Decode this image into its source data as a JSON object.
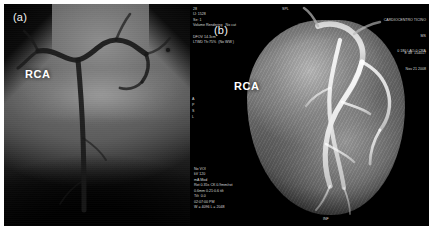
{
  "figure": {
    "caption_a": "(a)",
    "caption_b": "(b)"
  },
  "panel_a": {
    "modality": "invasive coronary angiography",
    "vessel_label": "RCA"
  },
  "panel_b": {
    "modality": "cardiac CT volume rendering",
    "vessel_label": "RCA",
    "overlay_top_left": "28\nIJ: 1528\nSe: 1\nVolume Rendering   No cut",
    "overlay_top_left_2": "DFOV 14.3cm\nLTWD Th:75%  (No WW )",
    "institution": "CARDIOCENTRO TICINO",
    "institution_sub": "MS",
    "patient_id": "E 48  154017",
    "study_date": "Nov 21 2008",
    "orientation_right": "0 180 LAO 0 CRA",
    "orientation_left_edge": "A\nP\nS\nL",
    "orientation_bottom": "INF",
    "marker_spl": "SPL",
    "scan_params": "No VOI\nkV 120\nmA Mod\nRot 0.35s CK 0.9mm/rot\n0.6mm 0.21:0.6 tilt\nTilt  0.0\n02:07:00 PM\nW = 4096 L = 2048"
  }
}
